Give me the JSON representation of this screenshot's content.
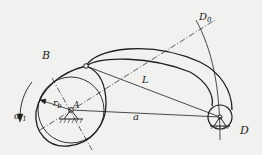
{
  "diagram": {
    "type": "cam-mechanism-oscillating-roller-follower",
    "background": "#f1f1ef",
    "stroke_color": "#1e1e1e",
    "labels": {
      "cam_body": "B",
      "cam_pivot": "A",
      "base_radius": "r",
      "base_radius_sub": "b",
      "angular_velocity": "ω",
      "angular_velocity_sub": "1",
      "follower_length": "L",
      "center_distance": "a",
      "follower_pivot": "D",
      "initial_position": "D",
      "initial_position_sub": "0"
    }
  }
}
